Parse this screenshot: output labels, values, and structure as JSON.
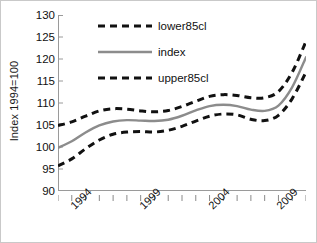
{
  "chart_data": {
    "type": "line",
    "title": "",
    "xlabel": "",
    "ylabel": "Index 1994=100",
    "ylim": [
      90,
      130
    ],
    "xlim": [
      1993,
      2011
    ],
    "yticks": [
      130,
      125,
      120,
      115,
      110,
      105,
      100,
      95,
      90
    ],
    "xticks_labeled": [
      "1994",
      "1999",
      "2004",
      "2009"
    ],
    "xticks_labeled_values": [
      1994,
      1999,
      2004,
      2009
    ],
    "grid": false,
    "legend_position": "top-center",
    "x": [
      1993,
      1994,
      1995,
      1996,
      1997,
      1998,
      1999,
      2000,
      2001,
      2002,
      2003,
      2004,
      2005,
      2006,
      2007,
      2008,
      2009,
      2010,
      2011
    ],
    "series": [
      {
        "name": "lower85cl",
        "style": "dashed",
        "color": "#111111",
        "values": [
          104.9,
          105.7,
          107.0,
          108.2,
          108.7,
          108.6,
          108.2,
          108.0,
          108.3,
          109.2,
          110.4,
          111.5,
          111.9,
          111.7,
          111.2,
          111.2,
          112.6,
          117.0,
          124.0
        ]
      },
      {
        "name": "index",
        "style": "solid",
        "color": "#8c8c8c",
        "values": [
          99.8,
          101.3,
          103.3,
          104.9,
          105.8,
          106.1,
          106.0,
          105.9,
          106.2,
          107.1,
          108.3,
          109.3,
          109.6,
          109.3,
          108.5,
          108.2,
          109.4,
          113.6,
          120.4
        ]
      },
      {
        "name": "upper85cl",
        "style": "dashed",
        "color": "#111111",
        "values": [
          95.7,
          97.3,
          99.6,
          101.6,
          102.9,
          103.4,
          103.5,
          103.4,
          103.8,
          104.7,
          105.9,
          107.0,
          107.5,
          107.3,
          106.3,
          106.0,
          107.2,
          111.0,
          117.0
        ]
      }
    ]
  },
  "legend": {
    "items": [
      {
        "label": "lower85cl",
        "style": "dashed"
      },
      {
        "label": "index",
        "style": "solid"
      },
      {
        "label": "upper85cl",
        "style": "dashed"
      }
    ]
  }
}
